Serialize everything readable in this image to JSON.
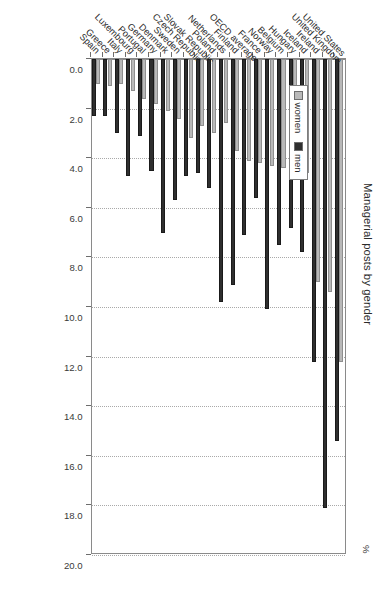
{
  "chart_data": {
    "type": "bar",
    "orientation": "horizontal",
    "title": "Managerial posts by gender",
    "unit_label": "%",
    "xlabel": "",
    "ylabel": "",
    "xlim": [
      0.0,
      20.0
    ],
    "xticks": [
      "0.0",
      "2.0",
      "4.0",
      "6.0",
      "8.0",
      "10.0",
      "12.0",
      "14.0",
      "16.0",
      "18.0",
      "20.0"
    ],
    "xtick_values": [
      0.0,
      2.0,
      4.0,
      6.0,
      8.0,
      10.0,
      12.0,
      14.0,
      16.0,
      18.0,
      20.0
    ],
    "grid": true,
    "legend_position": "upper-left",
    "categories": [
      "United States",
      "United Kingdom",
      "Ireland",
      "Iceland",
      "Hungary",
      "Belgium",
      "Norway",
      "France",
      "OECD average",
      "Finland",
      "Netherlands",
      "Poland",
      "Slovak Republic",
      "Czech Republic",
      "Sweden",
      "Denmark",
      "Germany",
      "Portugal",
      "Luxembourg",
      "Italy",
      "Greece",
      "Spain"
    ],
    "series": [
      {
        "name": "women",
        "color": "#b9b9b9",
        "values": [
          12.2,
          9.4,
          9.0,
          4.6,
          3.8,
          4.4,
          4.3,
          4.2,
          4.1,
          3.7,
          2.6,
          3.0,
          2.7,
          3.2,
          2.4,
          2.1,
          1.8,
          1.6,
          1.3,
          1.0,
          1.1,
          1.0
        ]
      },
      {
        "name": "men",
        "color": "#2f2f2f",
        "values": [
          15.4,
          18.1,
          12.2,
          7.8,
          6.8,
          7.5,
          10.1,
          5.6,
          7.1,
          9.1,
          9.8,
          5.2,
          4.6,
          4.7,
          5.7,
          7.0,
          4.5,
          3.1,
          4.7,
          3.0,
          2.3,
          2.3
        ]
      }
    ]
  },
  "legend": {
    "items": [
      {
        "label": "women",
        "icon": "square-swatch-light"
      },
      {
        "label": "men",
        "icon": "square-swatch-dark"
      }
    ]
  }
}
